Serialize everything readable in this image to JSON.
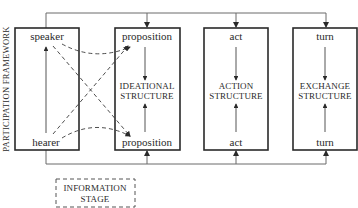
{
  "diagram": {
    "side_label": "PARTICIPATION FRAMEWORK",
    "boxes": [
      {
        "id": "participation",
        "top_label": "speaker",
        "bottom_label": "hearer",
        "center_label": [
          "",
          ""
        ]
      },
      {
        "id": "ideational",
        "top_label": "proposition",
        "bottom_label": "proposition",
        "center_label": [
          "IDEATIONAL",
          "STRUCTURE"
        ]
      },
      {
        "id": "action",
        "top_label": "act",
        "bottom_label": "act",
        "center_label": [
          "ACTION",
          "STRUCTURE"
        ]
      },
      {
        "id": "exchange",
        "top_label": "turn",
        "bottom_label": "turn",
        "center_label": [
          "EXCHANGE",
          "STRUCTURE"
        ]
      }
    ],
    "information_stage": [
      "INFORMATION",
      "STAGE"
    ],
    "colors": {
      "line": "#2a2a2a",
      "connector": "#6a6a6a",
      "background": "#ffffff"
    }
  }
}
